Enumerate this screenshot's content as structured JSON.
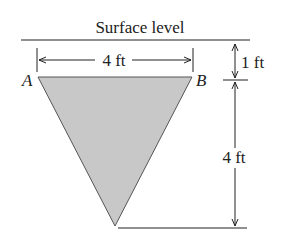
{
  "diagram": {
    "surface_label": "Surface level",
    "top_width_label": "4 ft",
    "depth_to_top_label": "1 ft",
    "triangle_height_label": "4 ft",
    "vertex_a": "A",
    "vertex_b": "B",
    "fill_color": "#c8c8c8",
    "line_color": "#222222"
  }
}
